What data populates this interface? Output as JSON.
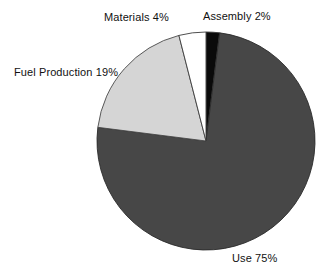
{
  "figure": {
    "background_color": "#FFFFFF",
    "text_color": "#111111"
  },
  "chart_data": {
    "type": "pie",
    "title": "",
    "subtitle": "",
    "xlabel": "",
    "ylabel": "",
    "grid": false,
    "legend_position": "none",
    "labels_position": "outside",
    "start_angle_deg": 0,
    "direction": "clockwise",
    "center_px": [
      206,
      141
    ],
    "radius_px": 109,
    "categories": [
      "Assembly",
      "Use",
      "Fuel Production",
      "Materials"
    ],
    "values": [
      2,
      19,
      75,
      4
    ],
    "slices": [
      {
        "name": "Assembly",
        "value": 2,
        "value_label": "2%",
        "label": "Assembly 2%",
        "color": "#0A0A0A",
        "edge_color": "#3A3A3A",
        "start_deg": 0,
        "end_deg": 7.2
      },
      {
        "name": "Use",
        "value": 75,
        "value_label": "75%",
        "label": "Use 75%",
        "color": "#474747",
        "edge_color": "#2B2B2B",
        "start_deg": 7.2,
        "end_deg": 277.2
      },
      {
        "name": "Fuel Production",
        "value": 19,
        "value_label": "19%",
        "label": "Fuel Production 19%",
        "color": "#D5D5D5",
        "edge_color": "#4A4A4A",
        "start_deg": 277.2,
        "end_deg": 345.6
      },
      {
        "name": "Materials",
        "value": 4,
        "value_label": "4%",
        "label": "Materials 4%",
        "color": "#FFFFFF",
        "edge_color": "#3A3A3A",
        "start_deg": 345.6,
        "end_deg": 360
      }
    ]
  }
}
